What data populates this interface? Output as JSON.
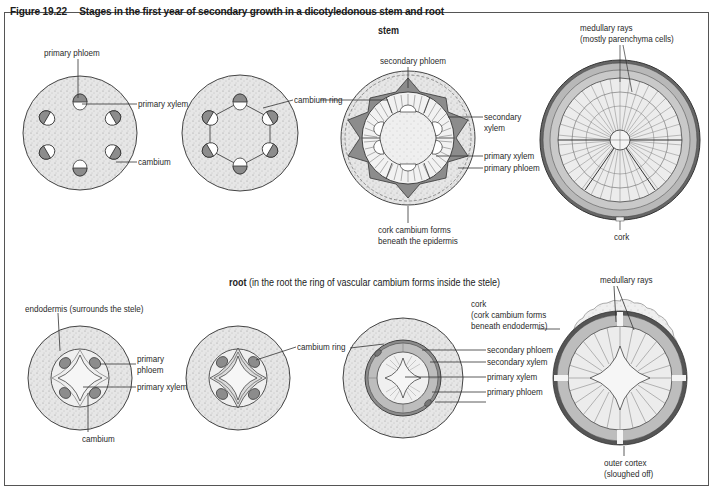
{
  "figure": {
    "number": "Figure 19.22",
    "title": "Stages in the first year of secondary growth in a dicotyledonous stem and root"
  },
  "stem_section": {
    "heading": "stem",
    "stage1_labels": {
      "primary_phloem": "primary phloem",
      "primary_xylem": "primary xylem",
      "cambium": "cambium"
    },
    "stage2_labels": {
      "cambium_ring": "cambium ring"
    },
    "stage3_labels": {
      "secondary_phloem": "secondary phloem",
      "secondary_xylem_line1": "secondary",
      "secondary_xylem_line2": "xylem",
      "primary_xylem": "primary xylem",
      "primary_phloem": "primary phloem",
      "cork_cambium_line1": "cork cambium forms",
      "cork_cambium_line2": "beneath the epidermis"
    },
    "stage4_labels": {
      "medullary_rays_line1": "medullary rays",
      "medullary_rays_line2": "(mostly parenchyma cells)",
      "cork": "cork"
    }
  },
  "root_section": {
    "heading": "root",
    "heading_note": "(in the root the ring of vascular cambium forms inside the stele)",
    "stage1_labels": {
      "endodermis": "endodermis (surrounds the stele)",
      "primary_phloem_line1": "primary",
      "primary_phloem_line2": "phloem",
      "primary_xylem": "primary xylem",
      "cambium": "cambium"
    },
    "stage2_labels": {
      "cambium_ring": "cambium ring"
    },
    "stage3_labels": {
      "cork_line1": "cork",
      "cork_line2": "(cork cambium forms",
      "cork_line3": "beneath endodermis)",
      "secondary_phloem": "secondary phloem",
      "secondary_xylem": "secondary xylem",
      "primary_xylem": "primary xylem",
      "primary_phloem": "primary phloem"
    },
    "stage4_labels": {
      "medullary_rays": "medullary rays",
      "outer_cortex_line1": "outer cortex",
      "outer_cortex_line2": "(sloughed off)"
    }
  },
  "colors": {
    "cortex_fill": "#e4e4e4",
    "tissue_dark": "#8c8c8c",
    "tissue_mid": "#b5b5b5",
    "xylem_light": "#f4f4f4",
    "outline": "#333333"
  }
}
